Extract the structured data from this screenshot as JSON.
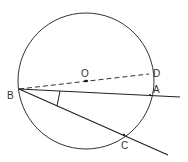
{
  "diagram": {
    "type": "geometry",
    "stroke_color": "#222222",
    "circle": {
      "center_label": "O",
      "cx": 86,
      "cy": 81,
      "r": 68
    },
    "points": {
      "B": {
        "label": "B",
        "x": 19,
        "y": 89
      },
      "O": {
        "label": "O",
        "x": 86,
        "y": 81
      },
      "D": {
        "label": "D",
        "x": 149,
        "y": 74
      },
      "A": {
        "label": "A",
        "x": 150,
        "y": 95
      },
      "C": {
        "label": "C",
        "x": 124,
        "y": 135
      }
    },
    "segments": [
      {
        "name": "line-BD-dashed",
        "from": "B",
        "to": "D",
        "style": "dashed"
      },
      {
        "name": "ray-BA",
        "from": "B",
        "through": "A",
        "style": "solid"
      },
      {
        "name": "ray-BC",
        "from": "B",
        "through": "C",
        "style": "solid"
      }
    ],
    "angle_mark": {
      "vertex": "B",
      "between": [
        "A",
        "C"
      ]
    }
  }
}
